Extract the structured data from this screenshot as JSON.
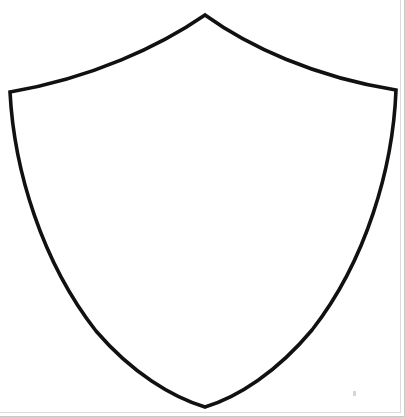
{
  "document": {
    "title": "Shield Outline",
    "type": "line-drawing",
    "description": "Blank heraldic pointed shield outline, black stroke on white background",
    "caption": ""
  },
  "canvas": {
    "width": 405,
    "height": 417,
    "background_color": "#ffffff"
  },
  "shape": {
    "name": "shield-outline",
    "stroke_color": "#111111",
    "fill_color": "#ffffff",
    "stroke_width": 3.6,
    "apex": {
      "x": 205,
      "y": 15
    },
    "left_shoulder": {
      "x": 10,
      "y": 92
    },
    "right_shoulder": {
      "x": 396,
      "y": 90
    },
    "bottom_point": {
      "x": 205,
      "y": 407
    },
    "path": "M 205 15 C 160 46, 92 78, 10 92 C 14 170, 42 262, 96 331 C 132 373, 172 397, 205 407 C 238 397, 277 372, 312 330 C 366 261, 393 168, 396 90 C 314 77, 248 46, 205 15 Z"
  },
  "page_edges": {
    "right_border_color": "#c9c9c9",
    "bottom_border_color": "#c9c9c9",
    "inner_border_color": "#dcdcdc"
  },
  "artifacts": [
    {
      "name": "scan-speck",
      "x": 353,
      "y": 391,
      "color": "#cfcfcf"
    }
  ]
}
